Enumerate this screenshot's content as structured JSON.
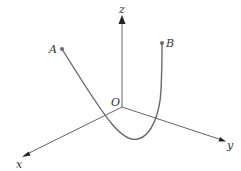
{
  "diagram": {
    "type": "3d-coordinate-axes-with-space-curve",
    "colors": {
      "background": "#ffffff",
      "axis": "#555555",
      "curve": "#6a6a6a",
      "label": "#333333"
    },
    "origin": {
      "label": "O"
    },
    "axes": {
      "x": {
        "label": "x"
      },
      "y": {
        "label": "y"
      },
      "z": {
        "label": "z"
      }
    },
    "points": [
      {
        "id": "A",
        "label": "A"
      },
      {
        "id": "B",
        "label": "B"
      }
    ],
    "curve": {
      "description": "U-shaped curve from A dipping below the xy-plane near origin and rising to B"
    }
  }
}
